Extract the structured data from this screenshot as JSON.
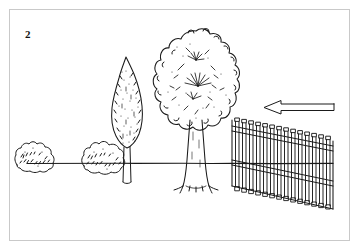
{
  "figure": {
    "label": "2",
    "caption": "",
    "domain_note": "black and white line drawing of a garden landscape scene",
    "border_color": "#c9c9c9",
    "ink_color": "#1a1a1a",
    "background_color": "#ffffff"
  },
  "scene": {
    "ground_line": {
      "name": "ground-line",
      "y": 163,
      "x_start": 27,
      "x_end": 333
    },
    "objects": [
      {
        "name": "bush-left",
        "type": "bush",
        "cx": 36,
        "cy": 157,
        "width": 42,
        "height": 32
      },
      {
        "name": "bush-center",
        "type": "bush",
        "cx": 104,
        "cy": 158,
        "width": 44,
        "height": 34
      },
      {
        "name": "tree-columnar",
        "type": "columnar-tree",
        "cx": 126,
        "cy": 110,
        "width": 40,
        "height": 130
      },
      {
        "name": "tree-deciduous",
        "type": "deciduous-tree",
        "cx": 196,
        "cy": 95,
        "width": 80,
        "height": 155
      },
      {
        "name": "fence",
        "type": "picket-fence",
        "x": 232,
        "y": 120,
        "width": 100,
        "height": 90,
        "pickets": 15
      },
      {
        "name": "direction-arrow",
        "type": "arrow",
        "x": 262,
        "y": 100,
        "width": 72,
        "height": 16,
        "direction": "left"
      }
    ]
  },
  "arrow": {
    "label": "",
    "direction": "left",
    "style": "outlined"
  }
}
